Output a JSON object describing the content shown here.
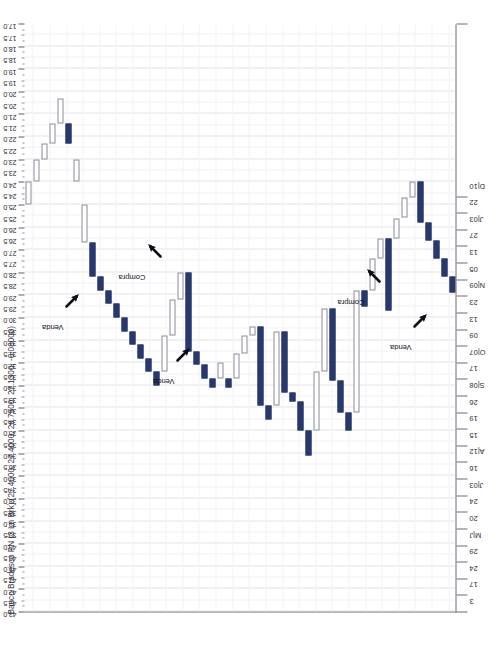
{
  "chart_data": {
    "type": "bar",
    "title": "Banco Bradesco PN (3 Ln Brk)  (27.4000, 27.4000, 26.7500, 27.1300, -0.08000)",
    "chart_style": "three-line-break",
    "orientation": "rotated-90",
    "xlabel": "",
    "ylabel": "",
    "price_axis": {
      "label": "Price",
      "position": "top",
      "min": 17.0,
      "max": 43.0,
      "step": 0.5,
      "grid": true,
      "tick_labels": [
        "43.0",
        "42.5",
        "42.0",
        "41.5",
        "41.0",
        "40.5",
        "40.0",
        "39.5",
        "39.0",
        "38.5",
        "38.0",
        "37.5",
        "37.0",
        "36.5",
        "36.0",
        "35.5",
        "35.0",
        "34.5",
        "34.0",
        "33.5",
        "33.0",
        "32.5",
        "32.0",
        "31.5",
        "31.0",
        "30.5",
        "30.0",
        "29.5",
        "29.0",
        "28.5",
        "28.0",
        "27.5",
        "27.0",
        "26.5",
        "26.0",
        "25.5",
        "25.0",
        "24.5",
        "24.0",
        "23.5",
        "23.0",
        "22.5",
        "22.0",
        "21.5",
        "21.0",
        "20.5",
        "20.0",
        "19.5",
        "19.0",
        "18.5",
        "18.0",
        "17.5",
        "17.0"
      ]
    },
    "time_axis": {
      "label": "Date",
      "position": "right",
      "grid": true,
      "tick_labels": [
        "3",
        "17",
        "24",
        "29",
        "M|J",
        "20",
        "24",
        "J|03",
        "16",
        "A|12",
        "15",
        "19",
        "26",
        "S|08",
        "17",
        "O|07",
        "09",
        "13",
        "23",
        "N|09",
        "05",
        "13",
        "27",
        "J|03",
        "22",
        "D|10"
      ]
    },
    "legend": {
      "position": "none",
      "entries": [
        {
          "name": "Alta (bloco preenchido)",
          "color": "#26386e"
        },
        {
          "name": "Baixa (bloco vazio)",
          "color": "#ffffff"
        }
      ]
    },
    "ohlc_last": {
      "open": 27.4,
      "high": 27.4,
      "low": 26.75,
      "close": 27.13,
      "change": -0.08
    },
    "blocks": [
      {
        "i": 0,
        "dir": "down",
        "top": 25.0,
        "bottom": 24.0
      },
      {
        "i": 1,
        "dir": "down",
        "top": 24.0,
        "bottom": 23.0
      },
      {
        "i": 2,
        "dir": "down",
        "top": 23.0,
        "bottom": 22.3
      },
      {
        "i": 3,
        "dir": "down",
        "top": 22.3,
        "bottom": 21.4
      },
      {
        "i": 4,
        "dir": "down",
        "top": 21.4,
        "bottom": 20.3
      },
      {
        "i": 5,
        "dir": "up",
        "top": 22.3,
        "bottom": 21.4
      },
      {
        "i": 6,
        "dir": "down",
        "top": 24.0,
        "bottom": 23.0
      },
      {
        "i": 7,
        "dir": "down",
        "top": 26.7,
        "bottom": 25.0
      },
      {
        "i": 8,
        "dir": "up",
        "top": 28.2,
        "bottom": 26.7
      },
      {
        "i": 9,
        "dir": "up",
        "top": 28.8,
        "bottom": 28.2
      },
      {
        "i": 10,
        "dir": "up",
        "top": 29.4,
        "bottom": 28.8
      },
      {
        "i": 11,
        "dir": "up",
        "top": 30.0,
        "bottom": 29.4
      },
      {
        "i": 12,
        "dir": "up",
        "top": 30.6,
        "bottom": 30.0
      },
      {
        "i": 13,
        "dir": "up",
        "top": 31.2,
        "bottom": 30.6
      },
      {
        "i": 14,
        "dir": "up",
        "top": 31.8,
        "bottom": 31.2
      },
      {
        "i": 15,
        "dir": "up",
        "top": 32.4,
        "bottom": 31.8
      },
      {
        "i": 16,
        "dir": "up",
        "top": 33.0,
        "bottom": 32.4
      },
      {
        "i": 17,
        "dir": "down",
        "top": 32.4,
        "bottom": 30.8
      },
      {
        "i": 18,
        "dir": "down",
        "top": 30.8,
        "bottom": 29.2
      },
      {
        "i": 19,
        "dir": "down",
        "top": 29.2,
        "bottom": 28.0
      },
      {
        "i": 20,
        "dir": "up",
        "top": 31.5,
        "bottom": 28.0
      },
      {
        "i": 21,
        "dir": "up",
        "top": 32.1,
        "bottom": 31.5
      },
      {
        "i": 22,
        "dir": "up",
        "top": 32.7,
        "bottom": 32.1
      },
      {
        "i": 23,
        "dir": "up",
        "top": 33.1,
        "bottom": 32.7
      },
      {
        "i": 24,
        "dir": "down",
        "top": 32.7,
        "bottom": 32.0
      },
      {
        "i": 25,
        "dir": "up",
        "top": 33.1,
        "bottom": 32.7
      },
      {
        "i": 26,
        "dir": "down",
        "top": 32.7,
        "bottom": 31.6
      },
      {
        "i": 27,
        "dir": "down",
        "top": 31.6,
        "bottom": 30.8
      },
      {
        "i": 28,
        "dir": "down",
        "top": 30.8,
        "bottom": 30.4
      },
      {
        "i": 29,
        "dir": "up",
        "top": 33.9,
        "bottom": 30.4
      },
      {
        "i": 30,
        "dir": "up",
        "top": 34.5,
        "bottom": 33.9
      },
      {
        "i": 31,
        "dir": "down",
        "top": 33.9,
        "bottom": 30.6
      },
      {
        "i": 32,
        "dir": "up",
        "top": 33.3,
        "bottom": 30.6
      },
      {
        "i": 33,
        "dir": "up",
        "top": 33.7,
        "bottom": 33.3
      },
      {
        "i": 34,
        "dir": "up",
        "top": 35.0,
        "bottom": 33.7
      },
      {
        "i": 35,
        "dir": "up",
        "top": 36.1,
        "bottom": 35.0
      },
      {
        "i": 36,
        "dir": "down",
        "top": 35.0,
        "bottom": 32.4
      },
      {
        "i": 37,
        "dir": "down",
        "top": 32.4,
        "bottom": 29.6
      },
      {
        "i": 38,
        "dir": "up",
        "top": 32.8,
        "bottom": 29.6
      },
      {
        "i": 39,
        "dir": "up",
        "top": 34.2,
        "bottom": 32.8
      },
      {
        "i": 40,
        "dir": "up",
        "top": 35.0,
        "bottom": 34.2
      },
      {
        "i": 41,
        "dir": "down",
        "top": 34.2,
        "bottom": 28.8
      },
      {
        "i": 42,
        "dir": "up",
        "top": 29.5,
        "bottom": 28.8
      },
      {
        "i": 43,
        "dir": "down",
        "top": 28.8,
        "bottom": 27.4
      },
      {
        "i": 44,
        "dir": "down",
        "top": 27.4,
        "bottom": 26.5
      },
      {
        "i": 45,
        "dir": "up",
        "top": 29.7,
        "bottom": 26.5
      },
      {
        "i": 46,
        "dir": "down",
        "top": 26.5,
        "bottom": 25.6
      },
      {
        "i": 47,
        "dir": "down",
        "top": 25.6,
        "bottom": 24.7
      },
      {
        "i": 48,
        "dir": "down",
        "top": 24.7,
        "bottom": 24.0
      },
      {
        "i": 49,
        "dir": "up",
        "top": 25.8,
        "bottom": 24.0
      },
      {
        "i": 50,
        "dir": "up",
        "top": 26.6,
        "bottom": 25.8
      },
      {
        "i": 51,
        "dir": "up",
        "top": 27.4,
        "bottom": 26.6
      },
      {
        "i": 52,
        "dir": "up",
        "top": 28.2,
        "bottom": 27.4
      },
      {
        "i": 53,
        "dir": "up",
        "top": 28.9,
        "bottom": 28.2
      }
    ],
    "annotations": [
      {
        "id": "venda-1",
        "label": "Venda",
        "x_frac": 0.075,
        "price": 28.7,
        "arrow": "down-right"
      },
      {
        "id": "compra-1",
        "label": "Compra",
        "x_frac": 0.265,
        "price": 26.5,
        "arrow": "down-left"
      },
      {
        "id": "venda-2",
        "label": "Venda",
        "x_frac": 0.33,
        "price": 31.1,
        "arrow": "down-right"
      },
      {
        "id": "compra-2",
        "label": "Compra",
        "x_frac": 0.77,
        "price": 27.6,
        "arrow": "down-left"
      },
      {
        "id": "venda-3",
        "label": "Venda",
        "x_frac": 0.88,
        "price": 29.6,
        "arrow": "down-right"
      }
    ],
    "colors": {
      "up_fill": "#26386e",
      "down_fill": "#ffffff",
      "down_stroke": "#8a8a97",
      "grid": "#e3e3ea",
      "axis": "#6b6b78",
      "text": "#2b2b33",
      "background": "#ffffff"
    }
  }
}
